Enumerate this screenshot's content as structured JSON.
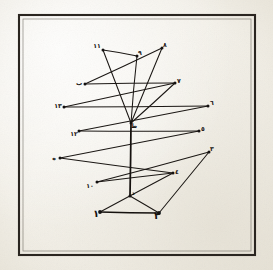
{
  "document": {
    "kind": "manuscript-diagram",
    "medium": "aged paper scan",
    "background_color": "#f4f2ec",
    "ink_color": "#1b1714",
    "frame": {
      "present": true,
      "style": "ruled rectangular border",
      "color": "#2a2520",
      "x": 18,
      "y": 14,
      "width": 238,
      "height": 242
    }
  },
  "figure": {
    "title": "Geometric zigzag figure with labelled vertices",
    "script": "Arabic-Indic numerals and Arabic letters",
    "vertices": [
      {
        "id": "v1",
        "label": "١",
        "label_text": "1",
        "x": 100,
        "y": 212,
        "label_x": 96,
        "label_y": 217,
        "label_size": "big"
      },
      {
        "id": "v2",
        "label": "٢",
        "label_text": "2",
        "x": 159,
        "y": 213,
        "label_x": 157,
        "label_y": 219,
        "label_size": "big"
      },
      {
        "id": "v3",
        "label": "٣",
        "label_text": "3",
        "x": 209,
        "y": 152,
        "label_x": 212,
        "label_y": 151,
        "label_size": "small"
      },
      {
        "id": "v4",
        "label": "٤",
        "label_text": "4",
        "x": 173,
        "y": 173,
        "label_x": 177,
        "label_y": 174,
        "label_size": "small"
      },
      {
        "id": "v5",
        "label": "٥",
        "label_text": "5",
        "x": 199,
        "y": 131,
        "label_x": 203,
        "label_y": 131,
        "label_size": "small"
      },
      {
        "id": "v6",
        "label": "٦",
        "label_text": "6",
        "x": 208,
        "y": 106,
        "label_x": 212,
        "label_y": 105,
        "label_size": "small"
      },
      {
        "id": "v7",
        "label": "٧",
        "label_text": "7",
        "x": 175,
        "y": 83,
        "label_x": 179,
        "label_y": 83,
        "label_size": "small"
      },
      {
        "id": "v8",
        "label": "٨",
        "label_text": "8",
        "x": 162,
        "y": 48,
        "label_x": 165,
        "label_y": 47,
        "label_size": "small"
      },
      {
        "id": "v9",
        "label": "٩",
        "label_text": "9",
        "x": 137,
        "y": 56,
        "label_x": 140,
        "label_y": 55,
        "label_size": "small"
      },
      {
        "id": "v10",
        "label": "١٠",
        "label_text": "10",
        "x": 97,
        "y": 182,
        "label_x": 90,
        "label_y": 188,
        "label_size": "small"
      },
      {
        "id": "v11",
        "label": "١١",
        "label_text": "11",
        "x": 103,
        "y": 50,
        "label_x": 97,
        "label_y": 48,
        "label_size": "small"
      },
      {
        "id": "v12",
        "label": "١٢",
        "label_text": "12",
        "x": 79,
        "y": 131,
        "label_x": 74,
        "label_y": 136,
        "label_size": "small"
      },
      {
        "id": "v13",
        "label": "١٣",
        "label_text": "13",
        "x": 64,
        "y": 107,
        "label_x": 58,
        "label_y": 108,
        "label_size": "small"
      },
      {
        "id": "vb",
        "label": "ب",
        "label_text": "b",
        "x": 85,
        "y": 84,
        "label_x": 79,
        "label_y": 85,
        "label_size": "small"
      },
      {
        "id": "vh",
        "label": "ه",
        "label_text": "h",
        "x": 60,
        "y": 158,
        "label_x": 54,
        "label_y": 160,
        "label_size": "small"
      },
      {
        "id": "vt",
        "label": "ط",
        "label_text": "t",
        "x": 131,
        "y": 123,
        "label_x": 134,
        "label_y": 128,
        "label_size": "small"
      },
      {
        "id": "vd",
        "label": "د",
        "label_text": "d",
        "x": 130,
        "y": 196,
        "label_x": 133,
        "label_y": 195,
        "label_size": "small"
      }
    ],
    "edges": [
      {
        "from": "v11",
        "to": "v9",
        "weight": "thin"
      },
      {
        "from": "v9",
        "to": "vt",
        "weight": "thin"
      },
      {
        "from": "v11",
        "to": "vt",
        "weight": "thin"
      },
      {
        "from": "v8",
        "to": "vt",
        "weight": "thin"
      },
      {
        "from": "vt",
        "to": "v7",
        "weight": "thin"
      },
      {
        "from": "vb",
        "to": "v7",
        "weight": "thin"
      },
      {
        "from": "vb",
        "to": "v8",
        "weight": "thin"
      },
      {
        "from": "v13",
        "to": "v6",
        "weight": "thin"
      },
      {
        "from": "v6",
        "to": "v12",
        "weight": "thin"
      },
      {
        "from": "v12",
        "to": "v5",
        "weight": "thin"
      },
      {
        "from": "v5",
        "to": "vh",
        "weight": "thin"
      },
      {
        "from": "vh",
        "to": "v4",
        "weight": "thin"
      },
      {
        "from": "v4",
        "to": "v10",
        "weight": "thin"
      },
      {
        "from": "v10",
        "to": "v3",
        "weight": "thin"
      },
      {
        "from": "v3",
        "to": "v2",
        "weight": "thin"
      },
      {
        "from": "v2",
        "to": "v1",
        "weight": "thick"
      },
      {
        "from": "v1",
        "to": "v4",
        "weight": "thin"
      },
      {
        "from": "vt",
        "to": "vd",
        "weight": "thick"
      },
      {
        "from": "vd",
        "to": "v2",
        "weight": "thin"
      },
      {
        "from": "v13",
        "to": "v7",
        "weight": "thin"
      }
    ],
    "axis": {
      "label": "vertical axis",
      "from": "vt",
      "to": "vd"
    }
  },
  "labels_rendered": [
    "١",
    "٢",
    "٣",
    "٤",
    "٥",
    "٦",
    "٧",
    "٨",
    "٩",
    "١٠",
    "١١",
    "١٢",
    "١٣",
    "ب",
    "ه",
    "ط",
    "د"
  ]
}
